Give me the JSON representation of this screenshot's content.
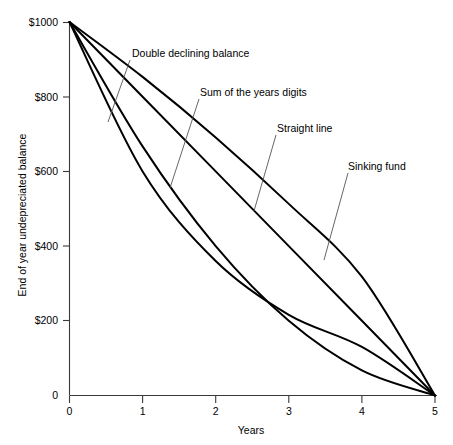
{
  "chart_data": {
    "type": "line",
    "title": "",
    "xlabel": "Years",
    "ylabel": "End of year undepreciated balance",
    "xlim": [
      0,
      5
    ],
    "ylim": [
      0,
      1000
    ],
    "grid": false,
    "legend_position": "inline-annotations",
    "x_ticks": [
      "0",
      "1",
      "2",
      "3",
      "4",
      "5"
    ],
    "x_tick_values": [
      0,
      1,
      2,
      3,
      4,
      5
    ],
    "y_ticks": [
      "0",
      "$200",
      "$400",
      "$600",
      "$800",
      "$1000"
    ],
    "y_tick_values": [
      0,
      200,
      400,
      600,
      800,
      1000
    ],
    "x": [
      0,
      1,
      2,
      3,
      4,
      5
    ],
    "series": [
      {
        "name": "Double declining balance",
        "values": [
          1000,
          600,
          360,
          216,
          130,
          0
        ],
        "label_x": 132,
        "label_y": 57,
        "leader": [
          [
            130,
            60
          ],
          [
            108,
            122
          ]
        ]
      },
      {
        "name": "Sum of the years digits",
        "values": [
          1000,
          667,
          400,
          200,
          67,
          0
        ],
        "label_x": 200,
        "label_y": 96,
        "leader": [
          [
            199,
            99
          ],
          [
            170,
            188
          ]
        ]
      },
      {
        "name": "Straight line",
        "values": [
          1000,
          800,
          600,
          400,
          200,
          0
        ],
        "label_x": 277,
        "label_y": 132,
        "leader": [
          [
            276,
            135
          ],
          [
            254,
            211
          ]
        ]
      },
      {
        "name": "Sinking fund",
        "values": [
          1000,
          853,
          691,
          513,
          318,
          0
        ],
        "label_x": 348,
        "label_y": 170,
        "leader": [
          [
            348,
            173
          ],
          [
            324,
            260
          ]
        ]
      }
    ]
  },
  "colors": {
    "curve": "#000000",
    "axis": "#3a3a3a",
    "leader": "#555555",
    "background": "#ffffff"
  }
}
